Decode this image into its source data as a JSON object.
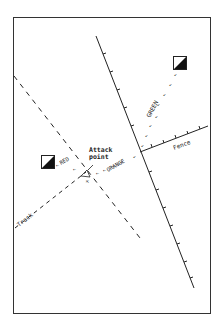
{
  "diagram": {
    "labels": {
      "attack_line1": "Attack",
      "attack_line2": "point",
      "green": "GREEN",
      "orange": "ORANGE",
      "red": "RED",
      "fence": "Fence",
      "track": "Track"
    },
    "colors": {
      "ink": "#222222",
      "frame": "#333333",
      "background": "#ffffff"
    }
  }
}
